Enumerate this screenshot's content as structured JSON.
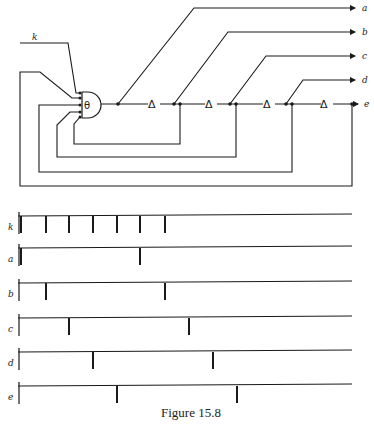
{
  "figure": {
    "caption": "Figure 15.8"
  },
  "circuit": {
    "input_label": "k",
    "gate_symbol": "θ",
    "delay_symbol": "Δ",
    "outputs": [
      "a",
      "b",
      "c",
      "d",
      "e"
    ]
  },
  "timing": {
    "rows": [
      {
        "label": "k",
        "ticks": [
          21,
          46,
          69,
          93,
          117,
          140,
          165
        ]
      },
      {
        "label": "a",
        "ticks": [
          21,
          140
        ]
      },
      {
        "label": "b",
        "ticks": [
          46,
          165
        ]
      },
      {
        "label": "c",
        "ticks": [
          69,
          189
        ]
      },
      {
        "label": "d",
        "ticks": [
          93,
          213
        ]
      },
      {
        "label": "e",
        "ticks": [
          117,
          237
        ]
      }
    ]
  }
}
